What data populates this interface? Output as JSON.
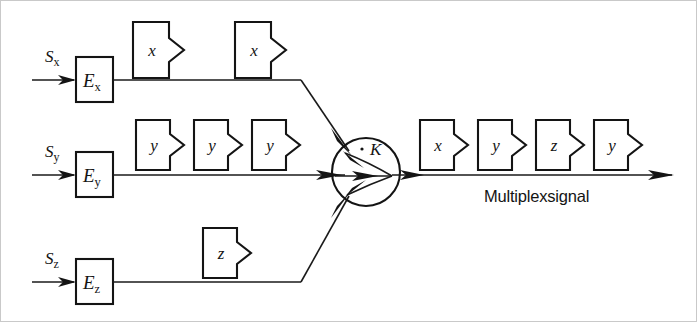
{
  "diagram": {
    "background_color": "#ffffff",
    "line_color": "#141414",
    "channels": [
      {
        "id": "x",
        "signal_label": "S",
        "signal_subscript": "x",
        "encoder_label": "E",
        "encoder_subscript": "x",
        "row_y": 80,
        "packets": [
          {
            "label": "x",
            "x": 133
          },
          {
            "label": "x",
            "x": 235
          }
        ]
      },
      {
        "id": "y",
        "signal_label": "S",
        "signal_subscript": "y",
        "encoder_label": "E",
        "encoder_subscript": "y",
        "row_y": 175,
        "packets": [
          {
            "label": "y",
            "x": 136
          },
          {
            "label": "y",
            "x": 194
          },
          {
            "label": "y",
            "x": 252
          }
        ]
      },
      {
        "id": "z",
        "signal_label": "S",
        "signal_subscript": "z",
        "encoder_label": "E",
        "encoder_subscript": "z",
        "row_y": 282,
        "packets": [
          {
            "label": "z",
            "x": 203
          }
        ]
      }
    ],
    "combiner": {
      "label": "K",
      "center_x": 366,
      "center_y": 172,
      "radius": 34
    },
    "output": {
      "line_y": 175,
      "caption": "Multiplexsignal",
      "packets": [
        {
          "label": "x",
          "x": 420
        },
        {
          "label": "y",
          "x": 478
        },
        {
          "label": "z",
          "x": 536
        },
        {
          "label": "y",
          "x": 594
        }
      ]
    }
  }
}
